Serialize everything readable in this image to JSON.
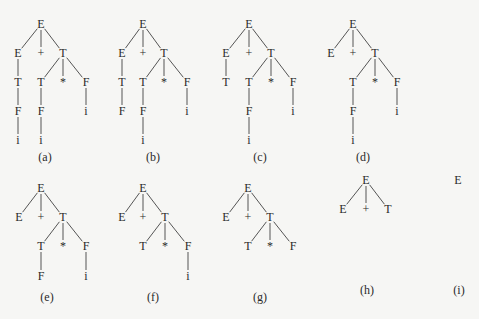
{
  "colors": {
    "background": "#f6f6f4",
    "ink": "#2a2a2a",
    "edge": "#555555"
  },
  "trees": [
    {
      "id": "a",
      "caption": "(a)",
      "caption_pos": [
        45,
        157
      ],
      "nodes": [
        {
          "label": "E",
          "x": 41,
          "y": 24
        },
        {
          "label": "E",
          "x": 18,
          "y": 53
        },
        {
          "label": "+",
          "x": 41,
          "y": 53
        },
        {
          "label": "T",
          "x": 63,
          "y": 53
        },
        {
          "label": "T",
          "x": 18,
          "y": 82
        },
        {
          "label": "T",
          "x": 41,
          "y": 82
        },
        {
          "label": "*",
          "x": 63,
          "y": 82
        },
        {
          "label": "F",
          "x": 86,
          "y": 82
        },
        {
          "label": "F",
          "x": 18,
          "y": 111
        },
        {
          "label": "F",
          "x": 41,
          "y": 111
        },
        {
          "label": "i",
          "x": 86,
          "y": 111
        },
        {
          "label": "i",
          "x": 18,
          "y": 140
        },
        {
          "label": "i",
          "x": 41,
          "y": 140
        }
      ],
      "edges": [
        [
          0,
          1
        ],
        [
          0,
          2
        ],
        [
          0,
          3
        ],
        [
          1,
          4
        ],
        [
          3,
          5
        ],
        [
          3,
          6
        ],
        [
          3,
          7
        ],
        [
          4,
          8
        ],
        [
          5,
          9
        ],
        [
          7,
          10
        ],
        [
          8,
          11
        ],
        [
          9,
          12
        ]
      ]
    },
    {
      "id": "b",
      "caption": "(b)",
      "caption_pos": [
        153,
        157
      ],
      "nodes": [
        {
          "label": "E",
          "x": 143,
          "y": 24
        },
        {
          "label": "E",
          "x": 122,
          "y": 53
        },
        {
          "label": "+",
          "x": 143,
          "y": 53
        },
        {
          "label": "T",
          "x": 164,
          "y": 53
        },
        {
          "label": "T",
          "x": 122,
          "y": 82
        },
        {
          "label": "T",
          "x": 143,
          "y": 82
        },
        {
          "label": "*",
          "x": 164,
          "y": 82
        },
        {
          "label": "F",
          "x": 187,
          "y": 82
        },
        {
          "label": "F",
          "x": 122,
          "y": 111
        },
        {
          "label": "F",
          "x": 143,
          "y": 111
        },
        {
          "label": "i",
          "x": 187,
          "y": 111
        },
        {
          "label": "i",
          "x": 143,
          "y": 140
        }
      ],
      "edges": [
        [
          0,
          1
        ],
        [
          0,
          2
        ],
        [
          0,
          3
        ],
        [
          1,
          4
        ],
        [
          3,
          5
        ],
        [
          3,
          6
        ],
        [
          3,
          7
        ],
        [
          4,
          8
        ],
        [
          5,
          9
        ],
        [
          7,
          10
        ],
        [
          9,
          11
        ]
      ]
    },
    {
      "id": "c",
      "caption": "(c)",
      "caption_pos": [
        260,
        157
      ],
      "nodes": [
        {
          "label": "E",
          "x": 249,
          "y": 24
        },
        {
          "label": "E",
          "x": 226,
          "y": 53
        },
        {
          "label": "+",
          "x": 249,
          "y": 53
        },
        {
          "label": "T",
          "x": 271,
          "y": 53
        },
        {
          "label": "T",
          "x": 226,
          "y": 82
        },
        {
          "label": "T",
          "x": 249,
          "y": 82
        },
        {
          "label": "*",
          "x": 271,
          "y": 82
        },
        {
          "label": "F",
          "x": 293,
          "y": 82
        },
        {
          "label": "F",
          "x": 249,
          "y": 111
        },
        {
          "label": "i",
          "x": 293,
          "y": 111
        },
        {
          "label": "i",
          "x": 249,
          "y": 140
        }
      ],
      "edges": [
        [
          0,
          1
        ],
        [
          0,
          2
        ],
        [
          0,
          3
        ],
        [
          1,
          4
        ],
        [
          3,
          5
        ],
        [
          3,
          6
        ],
        [
          3,
          7
        ],
        [
          5,
          8
        ],
        [
          7,
          9
        ],
        [
          8,
          10
        ]
      ]
    },
    {
      "id": "d",
      "caption": "(d)",
      "caption_pos": [
        363,
        157
      ],
      "nodes": [
        {
          "label": "E",
          "x": 353,
          "y": 24
        },
        {
          "label": "E",
          "x": 331,
          "y": 53
        },
        {
          "label": "+",
          "x": 353,
          "y": 53
        },
        {
          "label": "T",
          "x": 375,
          "y": 53
        },
        {
          "label": "T",
          "x": 353,
          "y": 82
        },
        {
          "label": "*",
          "x": 375,
          "y": 82
        },
        {
          "label": "F",
          "x": 397,
          "y": 82
        },
        {
          "label": "F",
          "x": 353,
          "y": 111
        },
        {
          "label": "i",
          "x": 397,
          "y": 111
        },
        {
          "label": "i",
          "x": 353,
          "y": 140
        }
      ],
      "edges": [
        [
          0,
          1
        ],
        [
          0,
          2
        ],
        [
          0,
          3
        ],
        [
          3,
          4
        ],
        [
          3,
          5
        ],
        [
          3,
          6
        ],
        [
          4,
          7
        ],
        [
          6,
          8
        ],
        [
          7,
          9
        ]
      ]
    },
    {
      "id": "e",
      "caption": "(e)",
      "caption_pos": [
        47,
        297
      ],
      "nodes": [
        {
          "label": "E",
          "x": 41,
          "y": 188
        },
        {
          "label": "E",
          "x": 19,
          "y": 217
        },
        {
          "label": "+",
          "x": 41,
          "y": 217
        },
        {
          "label": "T",
          "x": 63,
          "y": 217
        },
        {
          "label": "T",
          "x": 41,
          "y": 246
        },
        {
          "label": "*",
          "x": 63,
          "y": 246
        },
        {
          "label": "F",
          "x": 86,
          "y": 246
        },
        {
          "label": "F",
          "x": 41,
          "y": 276
        },
        {
          "label": "i",
          "x": 86,
          "y": 276
        }
      ],
      "edges": [
        [
          0,
          1
        ],
        [
          0,
          2
        ],
        [
          0,
          3
        ],
        [
          3,
          4
        ],
        [
          3,
          5
        ],
        [
          3,
          6
        ],
        [
          4,
          7
        ],
        [
          6,
          8
        ]
      ]
    },
    {
      "id": "f",
      "caption": "(f)",
      "caption_pos": [
        153,
        297
      ],
      "nodes": [
        {
          "label": "E",
          "x": 143,
          "y": 188
        },
        {
          "label": "E",
          "x": 122,
          "y": 217
        },
        {
          "label": "+",
          "x": 143,
          "y": 217
        },
        {
          "label": "T",
          "x": 165,
          "y": 217
        },
        {
          "label": "T",
          "x": 143,
          "y": 246
        },
        {
          "label": "*",
          "x": 165,
          "y": 246
        },
        {
          "label": "F",
          "x": 188,
          "y": 246
        },
        {
          "label": "i",
          "x": 188,
          "y": 276
        }
      ],
      "edges": [
        [
          0,
          1
        ],
        [
          0,
          2
        ],
        [
          0,
          3
        ],
        [
          3,
          4
        ],
        [
          3,
          5
        ],
        [
          3,
          6
        ],
        [
          6,
          7
        ]
      ]
    },
    {
      "id": "g",
      "caption": "(g)",
      "caption_pos": [
        260,
        297
      ],
      "nodes": [
        {
          "label": "E",
          "x": 248,
          "y": 188
        },
        {
          "label": "E",
          "x": 226,
          "y": 217
        },
        {
          "label": "+",
          "x": 248,
          "y": 217
        },
        {
          "label": "T",
          "x": 270,
          "y": 217
        },
        {
          "label": "T",
          "x": 248,
          "y": 246
        },
        {
          "label": "*",
          "x": 270,
          "y": 246
        },
        {
          "label": "F",
          "x": 293,
          "y": 246
        }
      ],
      "edges": [
        [
          0,
          1
        ],
        [
          0,
          2
        ],
        [
          0,
          3
        ],
        [
          3,
          4
        ],
        [
          3,
          5
        ],
        [
          3,
          6
        ]
      ]
    },
    {
      "id": "h",
      "caption": "(h)",
      "caption_pos": [
        367,
        290
      ],
      "nodes": [
        {
          "label": "E",
          "x": 366,
          "y": 180
        },
        {
          "label": "E",
          "x": 343,
          "y": 209
        },
        {
          "label": "+",
          "x": 366,
          "y": 209
        },
        {
          "label": "T",
          "x": 388,
          "y": 209
        }
      ],
      "edges": [
        [
          0,
          1
        ],
        [
          0,
          2
        ],
        [
          0,
          3
        ]
      ]
    },
    {
      "id": "i",
      "caption": "(i)",
      "caption_pos": [
        459,
        290
      ],
      "nodes": [
        {
          "label": "E",
          "x": 458,
          "y": 180
        }
      ],
      "edges": []
    }
  ]
}
